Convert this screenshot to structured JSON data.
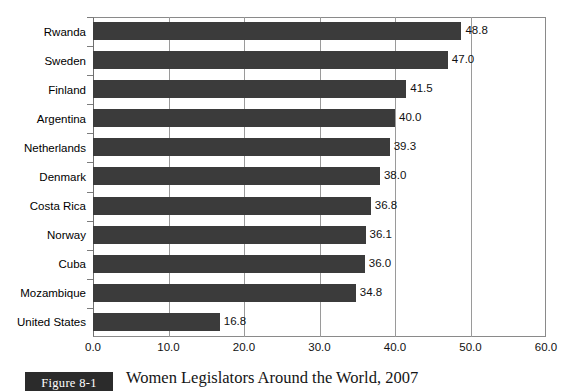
{
  "chart_data": {
    "type": "bar",
    "orientation": "horizontal",
    "title": "Women Legislators Around the World, 2007",
    "xlabel": "",
    "ylabel": "",
    "categories": [
      "Rwanda",
      "Sweden",
      "Finland",
      "Argentina",
      "Netherlands",
      "Denmark",
      "Costa Rica",
      "Norway",
      "Cuba",
      "Mozambique",
      "United States"
    ],
    "values": [
      48.8,
      47.0,
      41.5,
      40.0,
      39.3,
      38.0,
      36.8,
      36.1,
      36.0,
      34.8,
      16.8
    ],
    "value_labels": [
      "48.8",
      "47.0",
      "41.5",
      "40.0",
      "39.3",
      "38.0",
      "36.8",
      "36.1",
      "36.0",
      "34.8",
      "16.8"
    ],
    "xlim": [
      0.0,
      60.0
    ],
    "xticks": [
      0.0,
      10.0,
      20.0,
      30.0,
      40.0,
      50.0,
      60.0
    ],
    "xtick_labels": [
      "0.0",
      "10.0",
      "20.0",
      "30.0",
      "40.0",
      "50.0",
      "60.0"
    ],
    "grid": "vertical",
    "legend": "none",
    "bar_color": "#3b3b3b",
    "frame_color": "#8a8a8a",
    "gridline_color": "#9a9a9a"
  },
  "caption": {
    "figure_badge": "Figure 8-1",
    "title": "Women Legislators Around the World, 2007"
  }
}
